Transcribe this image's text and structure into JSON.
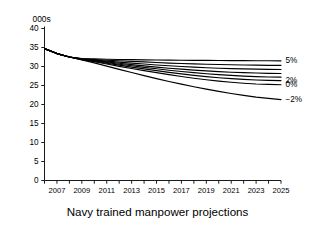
{
  "chart_data": {
    "type": "line",
    "title": "Navy trained manpower projections",
    "unit_label": "000s",
    "xlabel": "",
    "ylabel": "",
    "ylim": [
      0,
      40
    ],
    "yticks": [
      0,
      5,
      10,
      15,
      20,
      25,
      30,
      35,
      40
    ],
    "xlim": [
      2006,
      2025
    ],
    "xticks": [
      2007,
      2009,
      2011,
      2013,
      2015,
      2017,
      2019,
      2021,
      2023,
      2025
    ],
    "xtick_labels": [
      "2007",
      "2009",
      "2011",
      "2013",
      "2015",
      "2017",
      "2019",
      "2021",
      "2023",
      "2025"
    ],
    "minor_xticks": [
      2006,
      2008,
      2010,
      2012,
      2014,
      2016,
      2018,
      2020,
      2022,
      2024
    ],
    "grid": false,
    "legend_position": "right-of-axes",
    "x": [
      2006,
      2007,
      2008,
      2009,
      2010,
      2011,
      2012,
      2013,
      2014,
      2015,
      2016,
      2017,
      2018,
      2019,
      2020,
      2021,
      2022,
      2023,
      2024,
      2025
    ],
    "series": [
      {
        "name": "5%",
        "label": "5%",
        "show_label": true,
        "values": [
          34.7,
          33.4,
          32.5,
          32.1,
          32.0,
          31.9,
          31.85,
          31.8,
          31.75,
          31.7,
          31.68,
          31.65,
          31.62,
          31.6,
          31.58,
          31.56,
          31.54,
          31.52,
          31.5,
          31.5
        ]
      },
      {
        "name": "4%",
        "label": "",
        "show_label": false,
        "values": [
          34.7,
          33.4,
          32.5,
          32.05,
          31.85,
          31.65,
          31.5,
          31.35,
          31.2,
          31.05,
          30.9,
          30.78,
          30.68,
          30.6,
          30.52,
          30.45,
          30.4,
          30.35,
          30.3,
          30.3
        ]
      },
      {
        "name": "3.5%",
        "label": "",
        "show_label": false,
        "values": [
          34.7,
          33.4,
          32.5,
          32.0,
          31.7,
          31.4,
          31.15,
          30.9,
          30.65,
          30.4,
          30.2,
          30.0,
          29.82,
          29.68,
          29.55,
          29.45,
          29.36,
          29.3,
          29.25,
          29.2
        ]
      },
      {
        "name": "3%",
        "label": "",
        "show_label": false,
        "values": [
          34.7,
          33.4,
          32.5,
          31.95,
          31.6,
          31.2,
          30.85,
          30.5,
          30.18,
          29.85,
          29.55,
          29.3,
          29.05,
          28.85,
          28.65,
          28.5,
          28.38,
          28.28,
          28.2,
          28.15
        ]
      },
      {
        "name": "2.5%",
        "label": "",
        "show_label": false,
        "values": [
          34.7,
          33.4,
          32.5,
          31.9,
          31.5,
          31.05,
          30.6,
          30.2,
          29.78,
          29.4,
          29.02,
          28.68,
          28.38,
          28.1,
          27.85,
          27.65,
          27.48,
          27.35,
          27.25,
          27.2
        ]
      },
      {
        "name": "2%",
        "label": "2%",
        "show_label": true,
        "values": [
          34.7,
          33.4,
          32.5,
          31.85,
          31.38,
          30.85,
          30.35,
          29.85,
          29.38,
          28.9,
          28.45,
          28.05,
          27.68,
          27.35,
          27.05,
          26.8,
          26.6,
          26.45,
          26.35,
          26.3
        ]
      },
      {
        "name": "0%",
        "label": "0%",
        "show_label": true,
        "values": [
          34.7,
          33.4,
          32.5,
          31.8,
          31.25,
          30.65,
          30.05,
          29.48,
          28.92,
          28.38,
          27.85,
          27.38,
          26.92,
          26.52,
          26.15,
          25.85,
          25.6,
          25.4,
          25.28,
          25.2
        ]
      },
      {
        "name": "-2%",
        "label": "−2%",
        "show_label": true,
        "values": [
          34.7,
          33.4,
          32.5,
          31.7,
          30.95,
          30.1,
          29.25,
          28.42,
          27.6,
          26.82,
          26.05,
          25.35,
          24.68,
          24.05,
          23.45,
          22.9,
          22.4,
          21.95,
          21.6,
          21.3
        ]
      }
    ]
  }
}
